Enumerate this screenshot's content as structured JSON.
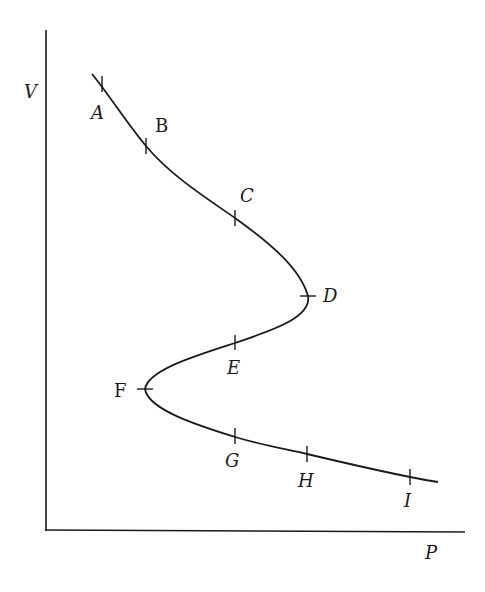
{
  "diagram": {
    "type": "P-V isotherm (S-shaped / van der Waals-like loop)",
    "axes": {
      "y_label": "V",
      "x_label": "P"
    },
    "points": [
      {
        "id": "A",
        "label": "A",
        "style": "italic",
        "tick": [
          102,
          84
        ],
        "orientation": "vertical"
      },
      {
        "id": "B",
        "label": "B",
        "style": "upright",
        "tick": [
          146,
          146
        ],
        "orientation": "vertical"
      },
      {
        "id": "C",
        "label": "C",
        "style": "italic",
        "tick": [
          235,
          218
        ],
        "orientation": "vertical"
      },
      {
        "id": "D",
        "label": "D",
        "style": "italic",
        "tick": [
          308,
          296
        ],
        "orientation": "horizontal"
      },
      {
        "id": "E",
        "label": "E",
        "style": "italic",
        "tick": [
          235,
          343
        ],
        "orientation": "vertical"
      },
      {
        "id": "F",
        "label": "F",
        "style": "upright",
        "tick": [
          145,
          389
        ],
        "orientation": "horizontal"
      },
      {
        "id": "G",
        "label": "G",
        "style": "italic",
        "tick": [
          235,
          437
        ],
        "orientation": "vertical"
      },
      {
        "id": "H",
        "label": "H",
        "style": "italic",
        "tick": [
          307,
          454
        ],
        "orientation": "vertical"
      },
      {
        "id": "I",
        "label": "I",
        "style": "italic",
        "tick": [
          410,
          477
        ],
        "orientation": "vertical"
      }
    ],
    "colors": {
      "ink": "#1a1a1a",
      "background": "#ffffff"
    }
  }
}
